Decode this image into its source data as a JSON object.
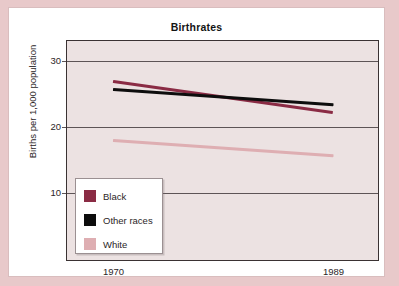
{
  "chart_data": {
    "type": "line",
    "title": "Birthrates",
    "xlabel": "",
    "ylabel": "Births per 1,000 population",
    "x": [
      1970,
      1989
    ],
    "x_tick_labels": [
      "1970",
      "1989"
    ],
    "y_tick_labels": [
      "10",
      "20",
      "30"
    ],
    "y_ticks": [
      10,
      20,
      30
    ],
    "ylim": [
      0,
      33
    ],
    "grid": true,
    "legend_position": "lower-left",
    "series": [
      {
        "name": "Black",
        "color": "#8a2b44",
        "values": [
          26.9,
          22.2
        ]
      },
      {
        "name": "Other races",
        "color": "#0d0d0d",
        "values": [
          25.6,
          23.3
        ]
      },
      {
        "name": "White",
        "color": "#deaeb2",
        "values": [
          17.9,
          15.6
        ]
      }
    ]
  },
  "legend": {
    "items": [
      {
        "label": "Black",
        "color": "#8a2b44"
      },
      {
        "label": "Other races",
        "color": "#0d0d0d"
      },
      {
        "label": "White",
        "color": "#deaeb2"
      }
    ]
  },
  "colors": {
    "page_border": "#e8c9ca",
    "card_background": "#ffffff",
    "plot_background": "#ece2e2",
    "axis": "#3a3233",
    "gridline": "#5d5456"
  }
}
